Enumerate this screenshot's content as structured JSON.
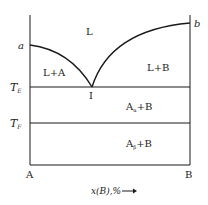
{
  "diagram": {
    "type": "binary-phase-diagram",
    "components": {
      "left": "A",
      "right": "B"
    },
    "x_axis_label": "x(B),%",
    "x_axis_arrow": "→",
    "points": {
      "a": "a",
      "b": "b",
      "eutectic": "I"
    },
    "temperatures": {
      "eutectic_main": "T",
      "eutectic_sub": "E",
      "transition_main": "T",
      "transition_sub": "F"
    },
    "regions": {
      "liquid": "L",
      "liquid_plus_A": "L+A",
      "liquid_plus_B": "L+B",
      "alpha_main": "A",
      "alpha_sub": "α",
      "alpha_rest": "+B",
      "beta_main": "A",
      "beta_sub": "β",
      "beta_rest": "+B"
    },
    "colors": {
      "line": "#1a1a1a",
      "text": "#222222",
      "background": "#ffffff"
    }
  }
}
